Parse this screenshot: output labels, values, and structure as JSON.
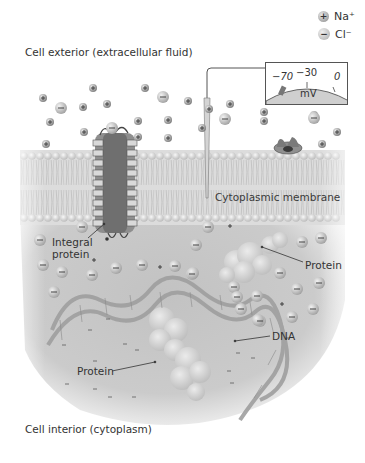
{
  "diagram": {
    "regions": {
      "exterior": "Cell exterior (extracellular fluid)",
      "interior": "Cell interior (cytoplasm)",
      "membrane": "Cytoplasmic membrane"
    },
    "legend": [
      {
        "symbol": "plus",
        "label": "Na⁺"
      },
      {
        "symbol": "minus",
        "label": "Cl⁻"
      }
    ],
    "meter": {
      "ticks": [
        "−70",
        "−30",
        "0"
      ],
      "unit": "mV",
      "needle_value": "−70"
    },
    "callouts": {
      "integral_protein": "Integral\nprotein",
      "protein_upper": "Protein",
      "dna": "DNA",
      "protein_lower": "Protein"
    },
    "colors": {
      "background": "#ffffff",
      "cytoplasm": "#c9c9c9",
      "membrane_head": "#d6d6d6",
      "ion_dark": "#8a8a8a",
      "ion_light": "#b5b5b5",
      "text": "#333333"
    }
  }
}
